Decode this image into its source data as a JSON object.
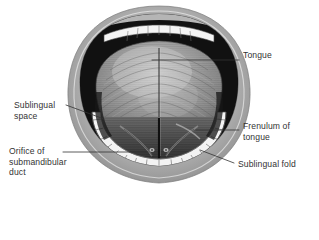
{
  "figure": {
    "view": "Anterior view of open mouth showing the underside and dorsum of the tongue",
    "style": "grayscale medical illustration",
    "background_color": "#ffffff",
    "line_color": "#333333",
    "colors": {
      "lip_outer": "#c2c2c2",
      "lip_mid": "#9a9a9a",
      "lip_inner_shadow": "#6e6e6e",
      "oral_cavity_dark": "#141414",
      "tongue_body": "#8f8f8f",
      "tongue_highlight": "#c8c8c8",
      "tongue_shadow": "#4a4a4a",
      "teeth_white": "#f2f2f2",
      "teeth_outline": "#5a5a5a",
      "sublingual_dark": "#3a3a3a"
    }
  },
  "labels": [
    {
      "id": "tongue",
      "text": "Tongue",
      "side": "right",
      "leader": {
        "x1": 152,
        "y1": 60,
        "x2": 239,
        "y2": 60
      }
    },
    {
      "id": "sublingual-space",
      "text": "Sublingual\nspace",
      "side": "left",
      "leader": {
        "x1": 66,
        "y1": 105,
        "x2": 104,
        "y2": 119
      }
    },
    {
      "id": "frenulum-of-tongue",
      "text": "Frenulum of\ntongue",
      "side": "right",
      "leader": {
        "x1": 196,
        "y1": 130,
        "x2": 239,
        "y2": 130
      }
    },
    {
      "id": "sublingual-fold",
      "text": "Sublingual fold",
      "side": "right",
      "leader": {
        "x1": 200,
        "y1": 150,
        "x2": 234,
        "y2": 163
      }
    },
    {
      "id": "orifice-of-submandibular-duct",
      "text": "Orifice of\nsubmandibular\nduct",
      "side": "left",
      "leader": {
        "x1": 63,
        "y1": 152,
        "x2": 148,
        "y2": 152
      }
    }
  ],
  "structures": [
    {
      "name": "upper-lip",
      "description": "gray rounded upper lip border"
    },
    {
      "name": "lower-lip",
      "description": "gray rounded lower lip border"
    },
    {
      "name": "upper-teeth",
      "description": "row of upper incisors, thin white strip"
    },
    {
      "name": "lower-teeth",
      "description": "arch of lower teeth, white segmented band"
    },
    {
      "name": "oral-cavity",
      "description": "dark cavity behind teeth"
    },
    {
      "name": "tongue-dorsum",
      "description": "large textured tongue body filling the mouth"
    },
    {
      "name": "median-sulcus",
      "description": "vertical groove down the midline of the tongue"
    },
    {
      "name": "frenulum",
      "description": "vertical midline fold beneath the tongue tip"
    },
    {
      "name": "sublingual-fold",
      "description": "raised fold on floor of mouth lateral to frenulum"
    },
    {
      "name": "sublingual-space",
      "description": "recess between tongue and lower teeth"
    },
    {
      "name": "submandibular-duct-orifice",
      "description": "small opening beside the frenulum base"
    }
  ]
}
